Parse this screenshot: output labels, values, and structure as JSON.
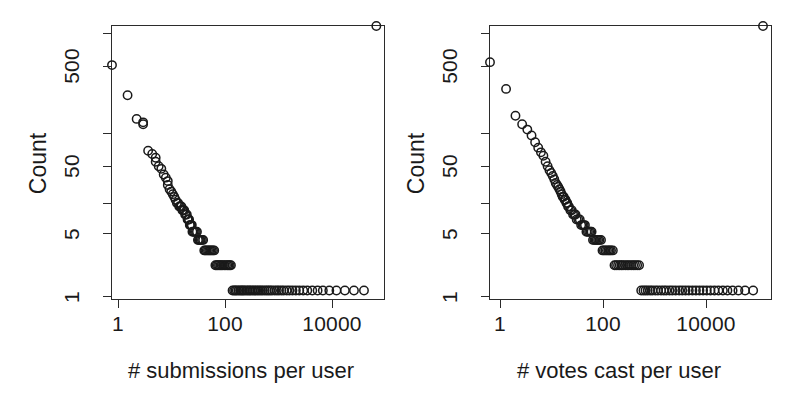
{
  "figure": {
    "background": "#ffffff",
    "ink_color": "#1a1a1a",
    "panel_count": 2
  },
  "chart_data": [
    {
      "id": "submissions-panel",
      "type": "scatter",
      "title": "",
      "xlabel": "# submissions per user",
      "ylabel": "Count",
      "xscale": "log",
      "yscale": "log",
      "xlim": [
        1,
        200000
      ],
      "ylim": [
        0.75,
        1400
      ],
      "grid": false,
      "legend": null,
      "marker": "open-circle",
      "xticks": [
        1,
        100,
        10000
      ],
      "xtick_labels": [
        "1",
        "100",
        "10000"
      ],
      "yticks": [
        1,
        5,
        50,
        500
      ],
      "ytick_labels": [
        "1",
        "5",
        "50",
        "500"
      ],
      "yticks_minor": [
        2,
        15,
        150,
        1200
      ],
      "x": [
        1,
        2,
        3,
        4,
        4,
        5,
        6,
        7,
        7,
        8,
        9,
        10,
        11,
        12,
        12,
        13,
        14,
        15,
        16,
        17,
        18,
        19,
        20,
        21,
        22,
        23,
        24,
        25,
        26,
        27,
        28,
        29,
        30,
        31,
        32,
        33,
        34,
        35,
        36,
        38,
        40,
        42,
        44,
        46,
        48,
        50,
        52,
        55,
        58,
        61,
        64,
        68,
        72,
        76,
        80,
        85,
        90,
        95,
        100,
        106,
        112,
        118,
        125,
        132,
        140,
        150,
        160,
        170,
        180,
        190,
        200,
        215,
        230,
        245,
        260,
        280,
        300,
        320,
        340,
        360,
        390,
        420,
        450,
        480,
        520,
        560,
        600,
        650,
        700,
        760,
        820,
        900,
        980,
        1060,
        1150,
        1250,
        1400,
        1550,
        1700,
        1900,
        2100,
        2400,
        2700,
        3100,
        3600,
        4200,
        5000,
        6000,
        7500,
        9500,
        12000,
        16000,
        22000,
        32000,
        48000,
        75000,
        130000
      ],
      "y": [
        480,
        210,
        110,
        100,
        95,
        46,
        42,
        38,
        34,
        30,
        28,
        24,
        22,
        20,
        18,
        16,
        15,
        14,
        13,
        12,
        11,
        11,
        10,
        10,
        10,
        9,
        9,
        9,
        8,
        8,
        8,
        7,
        7,
        7,
        6,
        6,
        6,
        6,
        5,
        5,
        5,
        5,
        5,
        4,
        4,
        4,
        4,
        4,
        4,
        3,
        3,
        3,
        3,
        3,
        3,
        3,
        3,
        3,
        2,
        2,
        2,
        2,
        2,
        2,
        2,
        2,
        2,
        2,
        2,
        2,
        2,
        1,
        1,
        1,
        1,
        1,
        1,
        1,
        1,
        1,
        1,
        1,
        1,
        1,
        1,
        1,
        1,
        1,
        1,
        1,
        1,
        1,
        1,
        1,
        1,
        1,
        1,
        1,
        1,
        1,
        1,
        1,
        1,
        1,
        1,
        1,
        1,
        1,
        1,
        1,
        1,
        1,
        1,
        1,
        1,
        1
      ],
      "notes": "Heavy-tailed power-law distribution; a long dense band of Count = 1 singletons extends across the high-submission range."
    },
    {
      "id": "votes-panel",
      "type": "scatter",
      "title": "",
      "xlabel": "# votes cast per user",
      "ylabel": "Count",
      "xscale": "log",
      "yscale": "log",
      "xlim": [
        1,
        200000
      ],
      "ylim": [
        0.75,
        1400
      ],
      "grid": false,
      "legend": null,
      "marker": "open-circle",
      "xticks": [
        1,
        100,
        10000
      ],
      "xtick_labels": [
        "1",
        "100",
        "10000"
      ],
      "yticks": [
        1,
        5,
        50,
        500
      ],
      "ytick_labels": [
        "1",
        "5",
        "50",
        "500"
      ],
      "yticks_minor": [
        2,
        15,
        150,
        1200
      ],
      "x": [
        1,
        2,
        3,
        4,
        5,
        6,
        7,
        8,
        9,
        10,
        11,
        12,
        13,
        14,
        15,
        16,
        17,
        18,
        19,
        20,
        21,
        22,
        23,
        24,
        25,
        26,
        27,
        28,
        29,
        30,
        32,
        34,
        36,
        38,
        40,
        42,
        45,
        48,
        51,
        54,
        57,
        60,
        64,
        68,
        72,
        76,
        80,
        85,
        90,
        95,
        100,
        106,
        112,
        120,
        128,
        136,
        145,
        155,
        165,
        175,
        185,
        200,
        215,
        230,
        250,
        270,
        290,
        310,
        340,
        370,
        400,
        440,
        480,
        520,
        570,
        620,
        680,
        750,
        820,
        900,
        1000,
        1100,
        1250,
        1400,
        1600,
        1800,
        2000,
        2300,
        2600,
        3000,
        3500,
        4000,
        4600,
        5300,
        6200,
        7200,
        8400,
        9800,
        11500,
        13500,
        16000,
        19000,
        23000,
        28000,
        35000,
        45000,
        60000,
        85000,
        130000
      ],
      "y": [
        520,
        250,
        120,
        95,
        82,
        70,
        58,
        50,
        44,
        40,
        34,
        30,
        27,
        25,
        23,
        21,
        19,
        18,
        17,
        16,
        15,
        14,
        13,
        13,
        12,
        12,
        11,
        11,
        10,
        10,
        9,
        9,
        8,
        8,
        8,
        7,
        7,
        7,
        6,
        6,
        6,
        6,
        5,
        5,
        5,
        5,
        5,
        4,
        4,
        4,
        4,
        4,
        4,
        4,
        3,
        3,
        3,
        3,
        3,
        3,
        3,
        3,
        2,
        2,
        2,
        2,
        2,
        2,
        2,
        2,
        2,
        2,
        2,
        2,
        2,
        2,
        1,
        1,
        1,
        1,
        1,
        1,
        1,
        1,
        1,
        1,
        1,
        1,
        1,
        1,
        1,
        1,
        1,
        1,
        1,
        1,
        1,
        1,
        1,
        1,
        1,
        1,
        1,
        1,
        1,
        1,
        1,
        1
      ],
      "notes": "Same heavy-tailed shape as submissions but decaying more gradually; the Count = 1 band reaches further to the right, with two isolated Count = 2 points near 1000-2000 votes."
    }
  ]
}
